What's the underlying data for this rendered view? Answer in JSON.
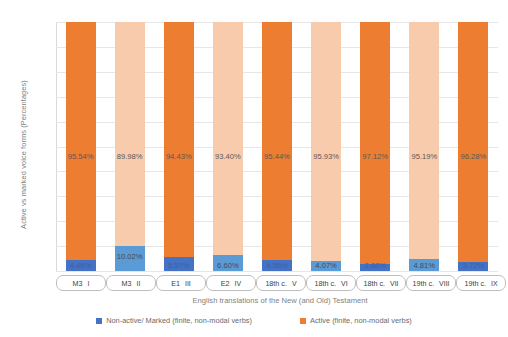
{
  "chart_data": {
    "type": "bar",
    "subtype": "stacked-100-percent",
    "title": "",
    "xlabel": "English translations of the New (and Old) Testament",
    "ylabel": "Active vs marked voice forms (Percentages)",
    "ylim": [
      0,
      100
    ],
    "ytick_labels": [
      "100%",
      "90%",
      "80%",
      "70%",
      "60%",
      "50%",
      "40%",
      "30%",
      "20%",
      "10%",
      "0%"
    ],
    "ytick_values": [
      100,
      90,
      80,
      70,
      60,
      50,
      40,
      30,
      20,
      10,
      0
    ],
    "grid": true,
    "legend_position": "bottom",
    "categories": [
      "M3  I",
      "M3  II",
      "E1  III",
      "E2  IV",
      "18th c.  V",
      "18th c.  VI",
      "18th c.  VII",
      "19th c.  VIII",
      "19th c.  IX"
    ],
    "category_parts": [
      {
        "name": "M3",
        "numeral": "I"
      },
      {
        "name": "M3",
        "numeral": "II"
      },
      {
        "name": "E1",
        "numeral": "III"
      },
      {
        "name": "E2",
        "numeral": "IV"
      },
      {
        "name": "18th c.",
        "numeral": "V"
      },
      {
        "name": "18th c.",
        "numeral": "VI"
      },
      {
        "name": "18th c.",
        "numeral": "VII"
      },
      {
        "name": "19th c.",
        "numeral": "VIII"
      },
      {
        "name": "19th c.",
        "numeral": "IX"
      }
    ],
    "series": [
      {
        "name": "Non-active/ Marked (finite, non-modal verbs)",
        "color_odd": "#4472C4",
        "color_even": "#5B9BD5",
        "values": [
          4.46,
          10.02,
          5.57,
          6.6,
          4.56,
          4.07,
          2.88,
          4.81,
          3.72
        ],
        "labels": [
          "4.46%",
          "10.02%",
          "5.57%",
          "6.60%",
          "4.56%",
          "4.07%",
          "2.88%",
          "4.81%",
          "3.72%"
        ]
      },
      {
        "name": "Active (finite, non-modal verbs)",
        "color_odd": "#ED7D31",
        "color_even": "#F8CBAD",
        "values": [
          95.54,
          89.98,
          94.43,
          93.4,
          95.44,
          95.93,
          97.12,
          95.19,
          96.28
        ],
        "labels": [
          "95.54%",
          "89.98%",
          "94.43%",
          "93.40%",
          "95.44%",
          "95.93%",
          "97.12%",
          "95.19%",
          "96.28%"
        ]
      }
    ]
  },
  "legend": {
    "items": [
      {
        "label": "Non-active/ Marked (finite, non-modal verbs)",
        "color": "#4472C4"
      },
      {
        "label": "Active (finite, non-modal verbs)",
        "color": "#ED7D31"
      }
    ]
  },
  "colors": {
    "orange_dark": "#ED7D31",
    "orange_light": "#F8CBAD",
    "blue_dark": "#4472C4",
    "blue_light": "#5B9BD5",
    "gridline": "#E6E6E6",
    "text": "#7F7F7F"
  }
}
